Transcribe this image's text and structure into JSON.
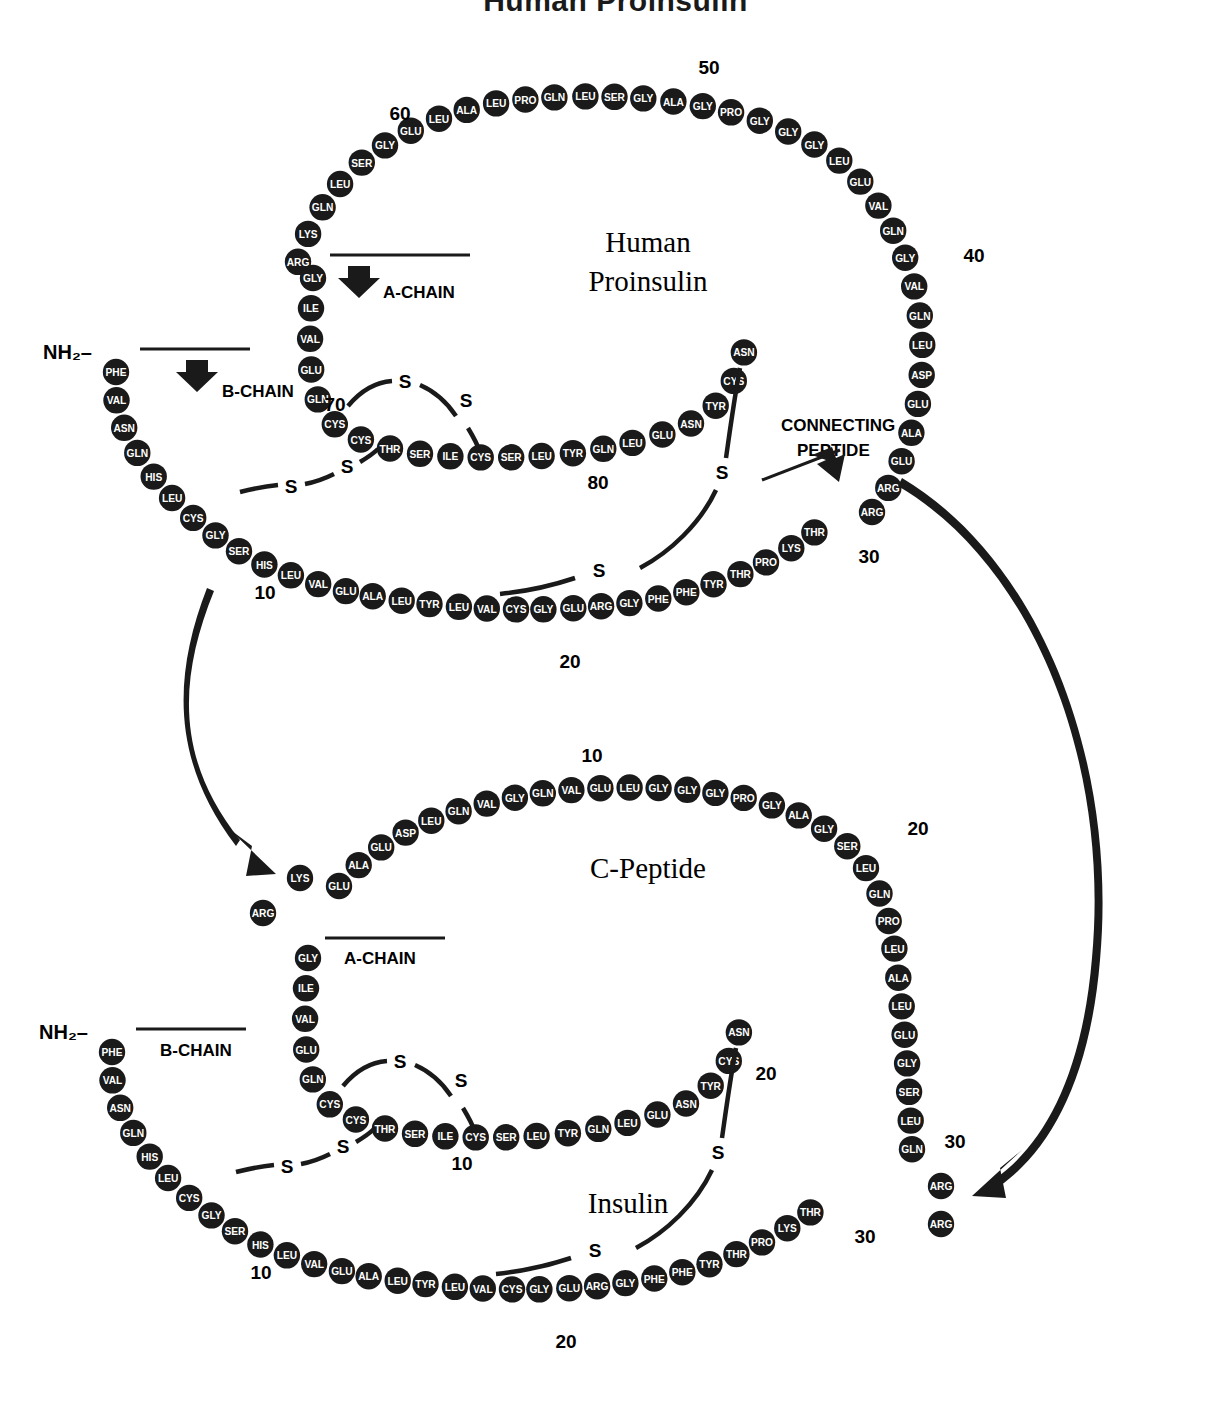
{
  "top_title": "Human Proinsulin",
  "panels": {
    "proinsulin": {
      "title_line1": "Human",
      "title_line2": "Proinsulin"
    },
    "cpeptide": {
      "title": "C-Peptide"
    },
    "insulin": {
      "title": "Insulin"
    }
  },
  "labels": {
    "nh2": "NH₂–",
    "b_chain": "B-CHAIN",
    "a_chain": "A-CHAIN",
    "connecting_peptide_line1": "CONNECTING",
    "connecting_peptide_line2": "PEPTIDE",
    "sulfur": "S"
  },
  "numbers": {
    "pro_10": "10",
    "pro_20": "20",
    "pro_30": "30",
    "pro_40": "40",
    "pro_50": "50",
    "pro_60": "60",
    "pro_70": "70",
    "pro_80": "80",
    "cp_10": "10",
    "cp_20": "20",
    "cp_30": "30",
    "ins_b10": "10",
    "ins_b20": "20",
    "ins_b30": "30",
    "ins_a10": "10",
    "ins_a20": "20"
  },
  "sequences": {
    "proinsulin_b_chain": [
      "PHE",
      "VAL",
      "ASN",
      "GLN",
      "HIS",
      "LEU",
      "CYS",
      "GLY",
      "SER",
      "HIS",
      "LEU",
      "VAL",
      "GLU",
      "ALA",
      "LEU",
      "TYR",
      "LEU",
      "VAL",
      "CYS",
      "GLY",
      "GLU",
      "ARG",
      "GLY",
      "PHE",
      "PHE",
      "TYR",
      "THR",
      "PRO",
      "LYS",
      "THR"
    ],
    "proinsulin_c_peptide": [
      "ARG",
      "ARG",
      "GLU",
      "ALA",
      "GLU",
      "ASP",
      "LEU",
      "GLN",
      "VAL",
      "GLY",
      "GLN",
      "VAL",
      "GLU",
      "LEU",
      "GLY",
      "GLY",
      "GLY",
      "PRO",
      "GLY",
      "ALA",
      "GLY",
      "SER",
      "LEU",
      "GLN",
      "PRO",
      "LEU",
      "ALA",
      "LEU",
      "GLU",
      "GLY",
      "SER",
      "LEU",
      "GLN",
      "LYS",
      "ARG"
    ],
    "proinsulin_a_chain": [
      "GLY",
      "ILE",
      "VAL",
      "GLU",
      "GLN",
      "CYS",
      "CYS",
      "THR",
      "SER",
      "ILE",
      "CYS",
      "SER",
      "LEU",
      "TYR",
      "GLN",
      "LEU",
      "GLU",
      "ASN",
      "TYR",
      "CYS",
      "ASN"
    ],
    "c_peptide_free": [
      "GLU",
      "ALA",
      "GLU",
      "ASP",
      "LEU",
      "GLN",
      "VAL",
      "GLY",
      "GLN",
      "VAL",
      "GLU",
      "LEU",
      "GLY",
      "GLY",
      "GLY",
      "PRO",
      "GLY",
      "ALA",
      "GLY",
      "SER",
      "LEU",
      "GLN",
      "PRO",
      "LEU",
      "ALA",
      "LEU",
      "GLU",
      "GLY",
      "SER",
      "LEU",
      "GLN"
    ],
    "insulin_b_chain": [
      "PHE",
      "VAL",
      "ASN",
      "GLN",
      "HIS",
      "LEU",
      "CYS",
      "GLY",
      "SER",
      "HIS",
      "LEU",
      "VAL",
      "GLU",
      "ALA",
      "LEU",
      "TYR",
      "LEU",
      "VAL",
      "CYS",
      "GLY",
      "GLU",
      "ARG",
      "GLY",
      "PHE",
      "PHE",
      "TYR",
      "THR",
      "PRO",
      "LYS",
      "THR"
    ],
    "insulin_a_chain": [
      "GLY",
      "ILE",
      "VAL",
      "GLU",
      "GLN",
      "CYS",
      "CYS",
      "THR",
      "SER",
      "ILE",
      "CYS",
      "SER",
      "LEU",
      "TYR",
      "GLN",
      "LEU",
      "GLU",
      "ASN",
      "TYR",
      "CYS",
      "ASN"
    ],
    "free_basic_left": [
      "LYS",
      "ARG"
    ],
    "free_basic_right": [
      "ARG",
      "ARG"
    ]
  }
}
